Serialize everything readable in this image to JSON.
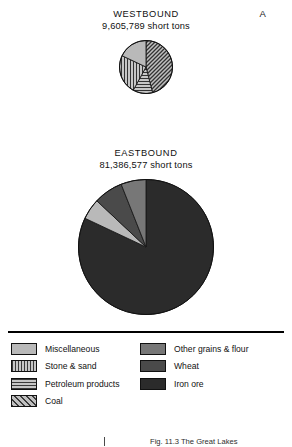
{
  "panel": {
    "label": "A"
  },
  "caption": {
    "text": "Fig. 11.3 The Great Lakes"
  },
  "legend": {
    "columns": [
      {
        "entries": [
          {
            "label": "Miscellaneous",
            "pattern": "solid-light",
            "swatch_name": "legend-swatch-miscellaneous"
          },
          {
            "label": "Stone & sand",
            "pattern": "vertical-stripes",
            "swatch_name": "legend-swatch-stone-sand"
          },
          {
            "label": "Petroleum products",
            "pattern": "horizontal-stripes",
            "swatch_name": "legend-swatch-petroleum-products"
          },
          {
            "label": "Coal",
            "pattern": "diagonal-hatch",
            "swatch_name": "legend-swatch-coal"
          }
        ]
      },
      {
        "entries": [
          {
            "label": "Other grains & flour",
            "pattern": "solid-medium",
            "swatch_name": "legend-swatch-other-grains-flour"
          },
          {
            "label": "Wheat",
            "pattern": "solid-dark",
            "swatch_name": "legend-swatch-wheat"
          },
          {
            "label": "Iron ore",
            "pattern": "solid-darkest",
            "swatch_name": "legend-swatch-iron-ore"
          }
        ]
      }
    ]
  },
  "chart_data": [
    {
      "type": "pie",
      "title": "WESTBOUND",
      "subtitle": "9,605,789 short tons",
      "units": "short tons",
      "total": 9605789,
      "radius_px": 25,
      "start_angle_deg": 0,
      "direction": "clockwise",
      "legend": "below",
      "categories": [
        "Coal",
        "Petroleum products",
        "Stone & sand",
        "Miscellaneous"
      ],
      "values": [
        46,
        12,
        24,
        18
      ],
      "value_unit": "percent",
      "slices": [
        {
          "label": "Coal",
          "percent": 46,
          "pattern": "diagonal-hatch",
          "fill": "#a8a8a8"
        },
        {
          "label": "Petroleum products",
          "percent": 12,
          "pattern": "horizontal-stripes",
          "fill": "#b0b0b0"
        },
        {
          "label": "Stone & sand",
          "percent": 24,
          "pattern": "vertical-stripes",
          "fill": "#b0b0b0"
        },
        {
          "label": "Miscellaneous",
          "percent": 18,
          "pattern": "solid-light",
          "fill": "#b9b9b9"
        }
      ]
    },
    {
      "type": "pie",
      "title": "EASTBOUND",
      "subtitle": "81,386,577 short tons",
      "units": "short tons",
      "total": 81386577,
      "radius_px": 66,
      "start_angle_deg": 0,
      "direction": "clockwise",
      "legend": "below",
      "categories": [
        "Iron ore",
        "Miscellaneous",
        "Wheat",
        "Other grains & flour"
      ],
      "values": [
        82,
        5,
        7,
        6
      ],
      "value_unit": "percent",
      "slices": [
        {
          "label": "Iron ore",
          "percent": 82,
          "pattern": "solid-darkest",
          "fill": "#2b2b2b"
        },
        {
          "label": "Miscellaneous",
          "percent": 5,
          "pattern": "solid-light",
          "fill": "#b9b9b9"
        },
        {
          "label": "Wheat",
          "percent": 7,
          "pattern": "solid-dark",
          "fill": "#4a4a4a"
        },
        {
          "label": "Other grains & flour",
          "percent": 6,
          "pattern": "solid-medium",
          "fill": "#777777"
        }
      ]
    }
  ]
}
